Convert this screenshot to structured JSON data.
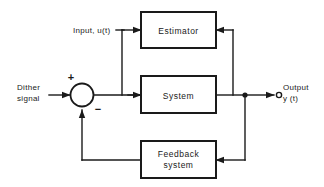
{
  "diagram": {
    "background_color": "#ffffff",
    "line_color": "#1a1a1a",
    "blocks": [
      {
        "id": "estimator",
        "label": "Estimator"
      },
      {
        "id": "system",
        "label": "System"
      },
      {
        "id": "feedback_system",
        "label_line1": "Feedback",
        "label_line2": "system"
      }
    ],
    "signals": {
      "dither_line1": "Dither",
      "dither_line2": "signal",
      "input": "Input, u(t)",
      "output_line1": "Output",
      "output_line2": "y (t)"
    },
    "summing_junction": {
      "plus": "+",
      "minus": "−"
    }
  }
}
